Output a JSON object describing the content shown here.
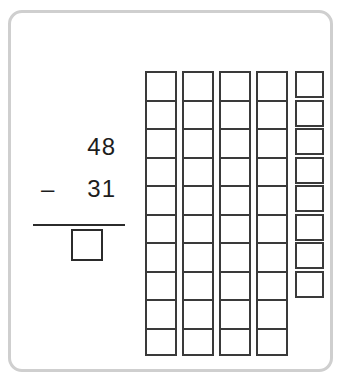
{
  "worksheet": {
    "problem": {
      "minuend": "48",
      "operator": "–",
      "subtrahend": "31",
      "answer": "",
      "answer_placeholder": ""
    },
    "blocks": {
      "rod_count": 4,
      "cells_per_rod": 10,
      "loose_unit_count": 8,
      "total_represented": 48,
      "rod_labels": [
        "ten-rod-1",
        "ten-rod-2",
        "ten-rod-3",
        "ten-rod-4"
      ]
    },
    "colors": {
      "card_border": "#cfcfcf",
      "block_outline": "#3a3a3a",
      "ink": "#1d1d1d",
      "rule": "#2b2b2b",
      "background": "#ffffff"
    }
  }
}
